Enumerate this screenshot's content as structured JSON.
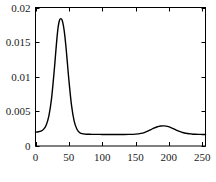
{
  "chart_data": {
    "type": "line",
    "title": "",
    "subtitle": "",
    "xlabel": "",
    "ylabel": "",
    "xlim": [
      0,
      255
    ],
    "ylim": [
      0,
      0.02
    ],
    "grid": false,
    "legend": null,
    "frame": "box",
    "tick_direction": "in",
    "line_color": "#000000",
    "background_color": "#ffffff",
    "axis_color": "#000000",
    "xticks": [
      0,
      50,
      100,
      150,
      200,
      250
    ],
    "xtick_labels": [
      "0",
      "50",
      "100",
      "150",
      "200",
      "250"
    ],
    "yticks": [
      0,
      0.005,
      0.01,
      0.015,
      0.02
    ],
    "ytick_labels": [
      "0",
      "0.005",
      "0.01",
      "0.015",
      "0.02"
    ],
    "series": [
      {
        "name": "curve",
        "x": [
          0,
          4,
          8,
          12,
          16,
          20,
          24,
          28,
          30,
          32,
          34,
          36,
          38,
          40,
          42,
          44,
          46,
          48,
          50,
          54,
          58,
          62,
          66,
          70,
          74,
          78,
          82,
          86,
          90,
          100,
          110,
          120,
          130,
          140,
          150,
          158,
          164,
          170,
          176,
          182,
          188,
          193,
          198,
          204,
          210,
          216,
          222,
          228,
          234,
          240,
          246,
          250,
          255
        ],
        "y": [
          0.002,
          0.00205,
          0.00215,
          0.0024,
          0.003,
          0.0043,
          0.0068,
          0.0108,
          0.0131,
          0.0154,
          0.0172,
          0.01815,
          0.0184,
          0.01815,
          0.0173,
          0.0159,
          0.014,
          0.0118,
          0.0096,
          0.0059,
          0.0036,
          0.00245,
          0.00195,
          0.00178,
          0.00172,
          0.0017,
          0.00169,
          0.00168,
          0.00168,
          0.00167,
          0.00167,
          0.00167,
          0.00167,
          0.00168,
          0.00172,
          0.00182,
          0.00198,
          0.00222,
          0.0025,
          0.00275,
          0.00288,
          0.0029,
          0.00283,
          0.00262,
          0.00235,
          0.0021,
          0.00192,
          0.0018,
          0.00174,
          0.0017,
          0.00168,
          0.00167,
          0.00166
        ]
      }
    ],
    "annotations": []
  },
  "axes": {
    "peak_primary": {
      "x": 38,
      "y": 0.0184
    },
    "peak_secondary": {
      "x": 193,
      "y": 0.0029
    },
    "baseline": 0.00167
  }
}
